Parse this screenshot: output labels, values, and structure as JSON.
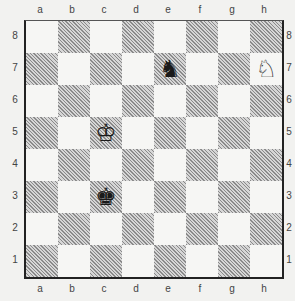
{
  "diagram": {
    "type": "chess-position",
    "files": [
      "a",
      "b",
      "c",
      "d",
      "e",
      "f",
      "g",
      "h"
    ],
    "ranks": [
      "8",
      "7",
      "6",
      "5",
      "4",
      "3",
      "2",
      "1"
    ],
    "colors": {
      "light_square": "#f6f6f4",
      "dark_square_hatch": "#8a8a8a",
      "border": "#222222"
    },
    "pieces": [
      {
        "square": "e7",
        "color": "black",
        "type": "knight",
        "glyph": "♞"
      },
      {
        "square": "h7",
        "color": "white",
        "type": "knight",
        "glyph": "♘"
      },
      {
        "square": "c5",
        "color": "white",
        "type": "king",
        "glyph": "♔"
      },
      {
        "square": "c3",
        "color": "black",
        "type": "king",
        "glyph": "♚"
      }
    ]
  }
}
